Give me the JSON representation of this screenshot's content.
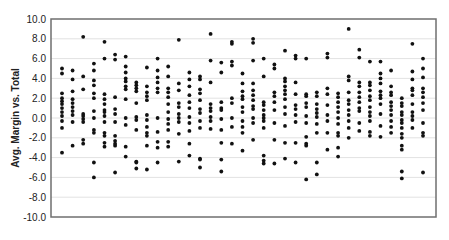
{
  "chart_data": {
    "type": "scatter",
    "title": "",
    "xlabel": "",
    "ylabel": "Avg. Margin vs. Total",
    "ylim": [
      -10,
      10
    ],
    "ytick_step": 2,
    "yticks": [
      "10.0",
      "8.0",
      "6.0",
      "4.0",
      "2.0",
      "0.0",
      "-2.0",
      "-4.0",
      "-6.0",
      "-8.0",
      "-10.0"
    ],
    "grid": true,
    "legend": null,
    "columns": [
      {
        "x": 1,
        "values": [
          5.0,
          4.5,
          2.5,
          2.0,
          1.7,
          1.4,
          1.0,
          0.6,
          0.2,
          -0.3,
          -1.0,
          -3.5
        ]
      },
      {
        "x": 2,
        "values": [
          4.8,
          3.9,
          2.7,
          1.9,
          1.5,
          1.1,
          0.7,
          0.3,
          -0.4,
          -2.8
        ]
      },
      {
        "x": 3,
        "values": [
          8.2,
          4.2,
          2.9,
          0.4,
          0.2,
          -0.1,
          -0.4,
          -2.2,
          -2.6
        ]
      },
      {
        "x": 4,
        "values": [
          5.5,
          4.8,
          3.8,
          3.3,
          2.5,
          2.0,
          0.7,
          0.0,
          -1.2,
          -1.5,
          -4.5,
          -6.0
        ]
      },
      {
        "x": 5,
        "values": [
          7.7,
          6.0,
          2.4,
          1.9,
          1.4,
          0.8,
          0.6,
          0.2,
          -0.4,
          -1.5,
          -1.8,
          -2.5,
          -2.9
        ]
      },
      {
        "x": 6,
        "values": [
          6.4,
          5.9,
          2.1,
          0.9,
          0.4,
          -0.4,
          -1.8,
          -2.3,
          -2.6,
          -2.8,
          -5.5
        ]
      },
      {
        "x": 7,
        "values": [
          6.2,
          5.2,
          4.6,
          4.0,
          3.7,
          3.2,
          2.9,
          1.9,
          0.0,
          -0.7,
          -2.9,
          -3.9
        ]
      },
      {
        "x": 8,
        "values": [
          3.6,
          3.3,
          3.0,
          2.7,
          1.5,
          0.1,
          -0.2,
          -1.2,
          -4.4,
          -4.5,
          -5.1
        ]
      },
      {
        "x": 9,
        "values": [
          5.1,
          3.2,
          2.6,
          2.2,
          1.8,
          0.3,
          -0.2,
          -0.9,
          -1.5,
          -1.8,
          -2.8,
          -5.2
        ]
      },
      {
        "x": 10,
        "values": [
          6.0,
          4.8,
          4.1,
          3.6,
          3.0,
          2.6,
          0.0,
          -1.4,
          -2.4,
          -3.0,
          -4.5
        ]
      },
      {
        "x": 11,
        "values": [
          5.2,
          4.2,
          3.0,
          2.6,
          2.1,
          1.4,
          0.6,
          -0.1,
          -0.6,
          -1.2,
          -2.4,
          -2.9
        ]
      },
      {
        "x": 12,
        "values": [
          7.9,
          3.5,
          2.8,
          1.5,
          1.1,
          0.4,
          0.0,
          -0.4,
          -1.6,
          -4.4
        ]
      },
      {
        "x": 13,
        "values": [
          4.6,
          3.9,
          3.2,
          2.3,
          1.6,
          1.0,
          0.1,
          -0.5,
          -1.3,
          -2.6,
          -3.8
        ]
      },
      {
        "x": 14,
        "values": [
          4.2,
          3.9,
          2.9,
          2.5,
          1.8,
          0.9,
          0.5,
          -0.3,
          -1.0,
          -4.1,
          -4.2,
          -5.0
        ]
      },
      {
        "x": 15,
        "values": [
          8.5,
          5.8,
          3.6,
          1.4,
          1.0,
          0.7,
          0.1,
          -0.3,
          -1.1
        ]
      },
      {
        "x": 16,
        "values": [
          5.6,
          4.6,
          1.6,
          1.0,
          0.8,
          -0.1,
          -1.2,
          -2.5,
          -4.2,
          -5.4
        ]
      },
      {
        "x": 17,
        "values": [
          7.7,
          7.5,
          5.7,
          5.3,
          2.0,
          1.5,
          0.0,
          -0.9,
          -2.6
        ]
      },
      {
        "x": 18,
        "values": [
          4.5,
          3.5,
          2.7,
          2.2,
          1.9,
          1.1,
          0.6,
          -0.3,
          -0.9,
          -1.5,
          -3.3
        ]
      },
      {
        "x": 19,
        "values": [
          8.0,
          7.6,
          5.8,
          3.5,
          2.8,
          2.3,
          1.8,
          1.2,
          0.9,
          0.0,
          -0.5,
          -2.2
        ]
      },
      {
        "x": 20,
        "values": [
          6.0,
          4.2,
          1.6,
          1.3,
          0.8,
          0.3,
          0.0,
          -0.3,
          -1.0,
          -3.8,
          -4.3,
          -4.6
        ]
      },
      {
        "x": 21,
        "values": [
          5.4,
          5.0,
          2.6,
          2.2,
          1.6,
          0.8,
          -0.5,
          -2.2,
          -4.6
        ]
      },
      {
        "x": 22,
        "values": [
          6.8,
          4.0,
          3.7,
          3.2,
          2.8,
          2.4,
          1.9,
          1.1,
          0.4,
          -0.8,
          -2.5,
          -4.1
        ]
      },
      {
        "x": 23,
        "values": [
          6.3,
          6.0,
          3.6,
          2.4,
          1.3,
          0.9,
          0.3,
          -0.4,
          -2.5,
          -4.5
        ]
      },
      {
        "x": 24,
        "values": [
          6.0,
          2.4,
          2.2,
          1.5,
          1.1,
          0.2,
          -0.5,
          -1.9,
          -2.6,
          -2.8,
          -6.2
        ]
      },
      {
        "x": 25,
        "values": [
          2.6,
          2.2,
          1.4,
          0.9,
          0.5,
          0.1,
          -0.6,
          -1.5,
          -4.5,
          -5.7
        ]
      },
      {
        "x": 26,
        "values": [
          6.5,
          6.1,
          3.0,
          2.4,
          1.3,
          0.3,
          -0.3,
          -1.5,
          -3.2
        ]
      },
      {
        "x": 27,
        "values": [
          2.5,
          2.1,
          1.6,
          1.1,
          0.6,
          0.0,
          -0.6,
          -1.5,
          -1.8,
          -3.0,
          -3.9
        ]
      },
      {
        "x": 28,
        "values": [
          9.0,
          4.2,
          3.8,
          2.6,
          1.8,
          1.4,
          0.8,
          0.3,
          -0.3,
          -1.0,
          -2.0
        ]
      },
      {
        "x": 29,
        "values": [
          6.9,
          6.1,
          3.6,
          3.2,
          2.6,
          2.1,
          1.6,
          1.0,
          0.7,
          -0.5,
          -1.3
        ]
      },
      {
        "x": 30,
        "values": [
          5.7,
          3.6,
          3.3,
          2.8,
          2.2,
          1.8,
          1.1,
          0.6,
          0.2,
          -0.3,
          -1.4,
          -1.8
        ]
      },
      {
        "x": 31,
        "values": [
          5.7,
          4.5,
          4.0,
          3.5,
          2.7,
          2.3,
          2.0,
          1.4,
          0.4,
          -0.8,
          -1.9
        ]
      },
      {
        "x": 32,
        "values": [
          4.8,
          3.2,
          2.6,
          2.3,
          1.6,
          1.2,
          0.8,
          0.3,
          -0.3,
          -0.9,
          -1.5
        ]
      },
      {
        "x": 33,
        "values": [
          2.0,
          1.5,
          1.2,
          0.6,
          0.3,
          -0.2,
          -0.5,
          -1.0,
          -1.6,
          -2.0,
          -2.8,
          -3.2,
          -5.4,
          -6.1
        ]
      },
      {
        "x": 34,
        "values": [
          7.5,
          4.7,
          3.9,
          3.0,
          2.8,
          2.3,
          1.4,
          0.6,
          0.2,
          -0.2,
          -1.0
        ]
      },
      {
        "x": 35,
        "values": [
          6.0,
          5.0,
          4.1,
          3.0,
          2.6,
          2.1,
          1.5,
          0.8,
          -0.5,
          -1.5,
          -1.8,
          -5.5
        ]
      }
    ]
  }
}
